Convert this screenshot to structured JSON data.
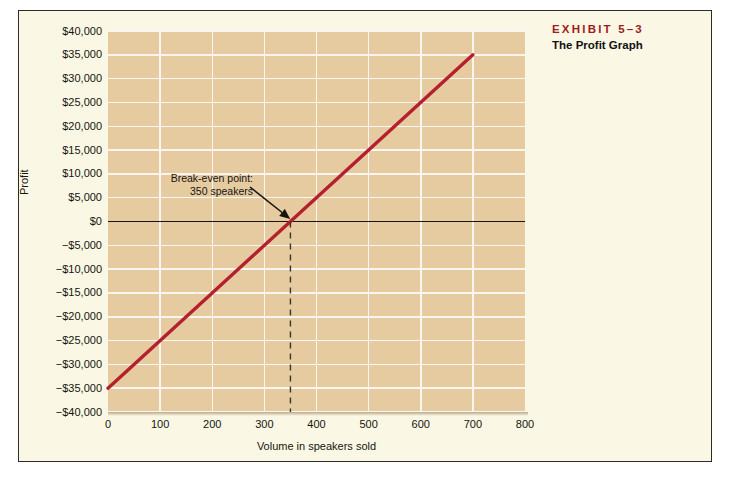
{
  "exhibit": {
    "label": "EXHIBIT 5–3",
    "title": "The Profit Graph"
  },
  "colors": {
    "accent_red": "#9e1b22",
    "line_red": "#b5202f",
    "plot_background": "#e6cba1",
    "panel_background": "#faf8e4",
    "gridline": "#fbf6ef",
    "zero_line": "#17150f"
  },
  "annotation": {
    "line1": "Break-even point:",
    "line2": "350 speakers"
  },
  "chart_data": {
    "type": "line",
    "title": "The Profit Graph",
    "xlabel": "Volume in speakers sold",
    "ylabel": "Profit",
    "xlim": [
      0,
      800
    ],
    "ylim": [
      -40000,
      40000
    ],
    "grid": true,
    "legend": "none",
    "x_ticks": [
      0,
      100,
      200,
      300,
      400,
      500,
      600,
      700,
      800
    ],
    "x_tick_labels": [
      "0",
      "100",
      "200",
      "300",
      "400",
      "500",
      "600",
      "700",
      "800"
    ],
    "y_ticks": [
      40000,
      35000,
      30000,
      25000,
      20000,
      15000,
      10000,
      5000,
      0,
      -5000,
      -10000,
      -15000,
      -20000,
      -25000,
      -30000,
      -35000,
      -40000
    ],
    "y_tick_labels": [
      "$40,000",
      "$35,000",
      "$30,000",
      "$25,000",
      "$20,000",
      "$15,000",
      "$10,000",
      "$5,000",
      "$0",
      "−$5,000",
      "−$10,000",
      "−$15,000",
      "−$20,000",
      "−$25,000",
      "−$30,000",
      "−$35,000",
      "−$40,000"
    ],
    "series": [
      {
        "name": "Profit",
        "color": "#b5202f",
        "x": [
          0,
          700
        ],
        "values": [
          -35000,
          35000
        ]
      }
    ],
    "zero_reference_line": 0,
    "break_even": {
      "x": 350,
      "y": 0,
      "label": "Break-even point: 350 speakers"
    }
  }
}
